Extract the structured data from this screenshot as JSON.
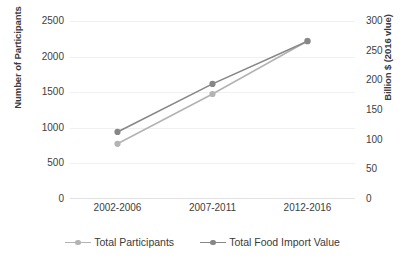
{
  "chart_data": {
    "type": "line",
    "title": "",
    "xlabel": "",
    "categories": [
      "2002-2006",
      "2007-2011",
      "2012-2016"
    ],
    "grid": true,
    "legend_position": "bottom",
    "axes": {
      "left": {
        "label": "Number of Participants",
        "ticks": [
          "0",
          "500",
          "1000",
          "1500",
          "2000",
          "2500"
        ],
        "tick_values": [
          0,
          500,
          1000,
          1500,
          2000,
          2500
        ],
        "min": 0,
        "max": 2500
      },
      "right": {
        "label": "Billion $ (2016 vlue)",
        "ticks": [
          "0",
          "50",
          "100",
          "150",
          "200",
          "250",
          "300"
        ],
        "tick_values": [
          0,
          50,
          100,
          150,
          200,
          250,
          300
        ],
        "min": 0,
        "max": 300
      }
    },
    "series": [
      {
        "name": "Total Participants",
        "axis": "left",
        "color": "#b3b3b3",
        "values": [
          775,
          1475,
          2220
        ]
      },
      {
        "name": "Total Food Import Value",
        "axis": "right",
        "color": "#878787",
        "values": [
          113,
          194,
          266
        ]
      }
    ]
  },
  "legend": {
    "items": [
      {
        "label": "Total Participants",
        "color": "#b3b3b3"
      },
      {
        "label": "Total Food Import Value",
        "color": "#878787"
      }
    ]
  }
}
